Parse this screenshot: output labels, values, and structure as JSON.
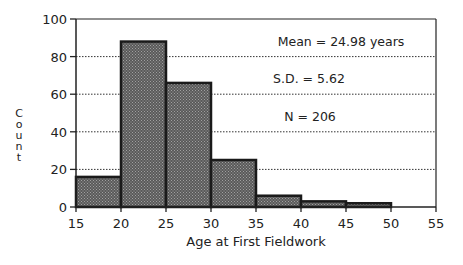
{
  "chart_data": {
    "type": "bar",
    "title": "",
    "xlabel": "Age at First Fieldwork",
    "ylabel": "Count",
    "bins": [
      [
        15,
        20
      ],
      [
        20,
        25
      ],
      [
        25,
        30
      ],
      [
        30,
        35
      ],
      [
        35,
        40
      ],
      [
        40,
        45
      ],
      [
        45,
        50
      ]
    ],
    "categories": [
      "15-20",
      "20-25",
      "25-30",
      "30-35",
      "35-40",
      "40-45",
      "45-50"
    ],
    "values": [
      16,
      88,
      66,
      25,
      6,
      3,
      2
    ],
    "xlim": [
      15,
      55
    ],
    "ylim": [
      0,
      100
    ],
    "xticks": [
      15,
      20,
      25,
      30,
      35,
      40,
      45,
      50,
      55
    ],
    "yticks": [
      0,
      20,
      40,
      60,
      80,
      100
    ],
    "grid": "horizontal dotted",
    "annotations": [
      "Mean = 24.98 years",
      "S.D. = 5.62",
      "N = 206"
    ],
    "bar_fill": "#6e6e6e",
    "bar_edge": "#1a1a1a"
  },
  "labels": {
    "ylabel": "Count",
    "xlabel": "Age at First Fieldwork",
    "mean": "Mean = 24.98 years",
    "sd": "S.D. = 5.62",
    "n": "N = 206"
  }
}
